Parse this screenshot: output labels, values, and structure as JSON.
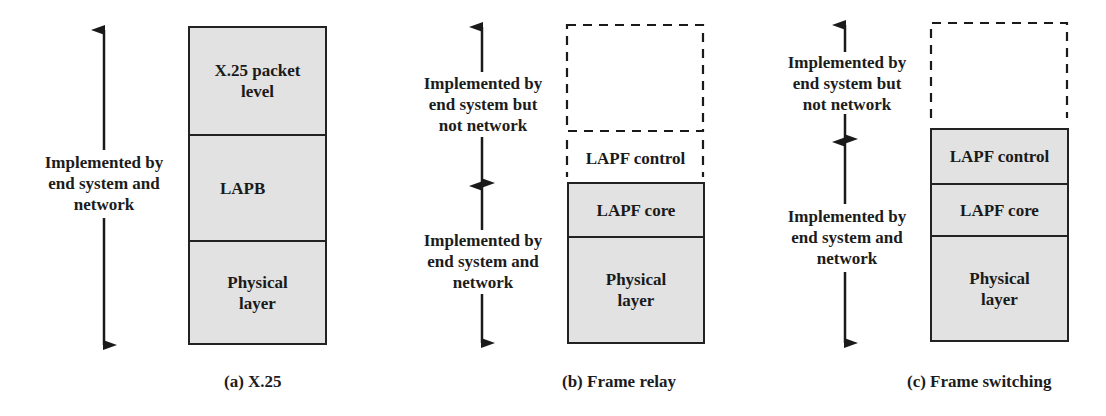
{
  "panels": [
    {
      "id": "a",
      "caption": "(a) X.25",
      "labels": [
        {
          "text": "Implemented by\nend system and\nnetwork",
          "scope": "end-system-and-network"
        }
      ],
      "dashed_layers": [],
      "layers": [
        {
          "label": "X.25 packet\nlevel"
        },
        {
          "label": "LAPB"
        },
        {
          "label": "Physical\nlayer"
        }
      ]
    },
    {
      "id": "b",
      "caption": "(b) Frame relay",
      "labels": [
        {
          "text": "Implemented by\nend system but\nnot network",
          "scope": "end-system-only"
        },
        {
          "text": "Implemented by\nend system and\nnetwork",
          "scope": "end-system-and-network"
        }
      ],
      "dashed_layers": [
        {
          "label": ""
        },
        {
          "label": "LAPF control"
        }
      ],
      "layers": [
        {
          "label": "LAPF core"
        },
        {
          "label": "Physical\nlayer"
        }
      ]
    },
    {
      "id": "c",
      "caption": "(c) Frame switching",
      "labels": [
        {
          "text": "Implemented by\nend system but\nnot network",
          "scope": "end-system-only"
        },
        {
          "text": "Implemented by\nend system and\nnetwork",
          "scope": "end-system-and-network"
        }
      ],
      "dashed_layers": [
        {
          "label": ""
        }
      ],
      "layers": [
        {
          "label": "LAPF control"
        },
        {
          "label": "LAPF core"
        },
        {
          "label": "Physical\nlayer"
        }
      ]
    }
  ],
  "colors": {
    "layer_fill": "#e2e2e2",
    "stroke": "#222222",
    "background": "#ffffff"
  }
}
